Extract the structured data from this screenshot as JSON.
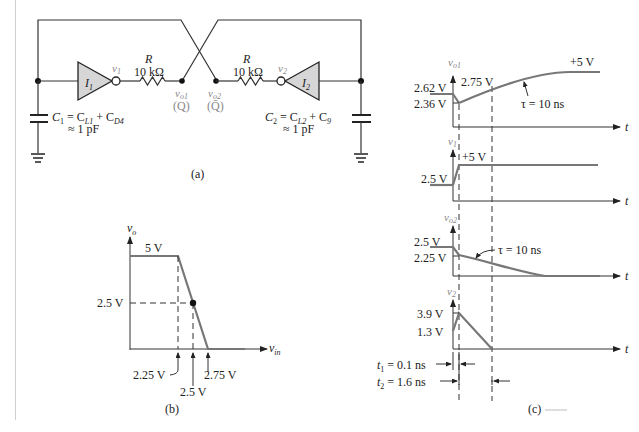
{
  "figure": {
    "panels": {
      "a": {
        "caption": "(a)",
        "inverter1": "I",
        "inverter1_sub": "1",
        "inverter2": "I",
        "inverter2_sub": "2",
        "resistor1": {
          "name": "R",
          "value": "10 kΩ"
        },
        "resistor2": {
          "name": "R",
          "value": "10 kΩ"
        },
        "node_v1": "v",
        "node_v1_sub": "1",
        "node_v2": "v",
        "node_v2_sub": "2",
        "node_vo1": "v",
        "node_vo1_sub": "o1",
        "node_vo1_alias": "(Q)",
        "node_vo2": "v",
        "node_vo2_sub": "o2",
        "node_vo2_alias": "(Q̄)",
        "c1_eq_line1_a": "C",
        "c1_eq_line1_a_sub": "1",
        "c1_eq_line1_b": " = C",
        "c1_eq_line1_b_sub": "L1",
        "c1_eq_line1_c": " + C",
        "c1_eq_line1_c_sub": "D4",
        "c1_eq_line2": "≈ 1 pF",
        "c2_eq_line1_a": "C",
        "c2_eq_line1_a_sub": "2",
        "c2_eq_line1_b": " = C",
        "c2_eq_line1_b_sub": "L2",
        "c2_eq_line1_c": " + C",
        "c2_eq_line1_c_sub": "9",
        "c2_eq_line2": "≈ 1 pF"
      },
      "b": {
        "caption": "(b)",
        "y_axis": "v",
        "y_axis_sub": "o",
        "x_axis": "v",
        "x_axis_sub": "in",
        "vout_high": "5 V",
        "vout_mid": "2.5 V",
        "vin_ticks": [
          "2.25 V",
          "2.5 V",
          "2.75 V"
        ]
      },
      "c": {
        "caption": "(c)",
        "t_label": "t",
        "waveforms": [
          {
            "name": "v",
            "sub": "o1",
            "labels": [
              "2.62 V",
              "2.36 V",
              "2.75 V",
              "+5 V"
            ],
            "tau": "τ = 10 ns"
          },
          {
            "name": "v",
            "sub": "1",
            "labels": [
              "2.5 V",
              "+5 V"
            ]
          },
          {
            "name": "v",
            "sub": "o2",
            "labels": [
              "2.5 V",
              "2.25 V"
            ],
            "tau": "τ = 10 ns"
          },
          {
            "name": "v",
            "sub": "2",
            "labels": [
              "3.9 V",
              "1.3 V"
            ]
          }
        ],
        "t1": {
          "name": "t",
          "sub": "1",
          "value": " = 0.1 ns"
        },
        "t2": {
          "name": "t",
          "sub": "2",
          "value": " = 1.6 ns"
        }
      }
    }
  }
}
